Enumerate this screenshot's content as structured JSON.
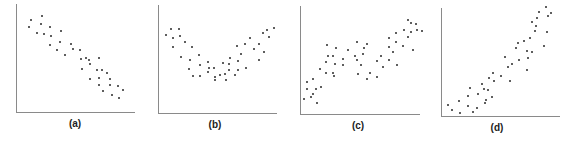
{
  "chart_data": [
    {
      "type": "scatter",
      "label": "(a)",
      "description": "negative linear relationship",
      "title": "",
      "xlabel": "",
      "ylabel": "",
      "grid": false,
      "axes": {
        "x0": 16,
        "y0": 112,
        "x1": 135,
        "ytop": 4
      },
      "label_pos": {
        "x": 75,
        "y": 118
      },
      "points_px": [
        [
          31,
          20
        ],
        [
          42,
          16
        ],
        [
          29,
          27
        ],
        [
          41,
          24
        ],
        [
          50,
          27
        ],
        [
          37,
          33
        ],
        [
          44,
          34
        ],
        [
          51,
          36
        ],
        [
          61,
          31
        ],
        [
          60,
          42
        ],
        [
          50,
          45
        ],
        [
          57,
          50
        ],
        [
          71,
          44
        ],
        [
          65,
          55
        ],
        [
          73,
          49
        ],
        [
          80,
          50
        ],
        [
          81,
          59
        ],
        [
          86,
          58
        ],
        [
          89,
          60
        ],
        [
          99,
          58
        ],
        [
          82,
          69
        ],
        [
          90,
          64
        ],
        [
          102,
          70
        ],
        [
          97,
          70
        ],
        [
          107,
          73
        ],
        [
          90,
          79
        ],
        [
          99,
          78
        ],
        [
          110,
          79
        ],
        [
          99,
          85
        ],
        [
          110,
          85
        ],
        [
          118,
          86
        ],
        [
          103,
          91
        ],
        [
          112,
          95
        ],
        [
          119,
          98
        ],
        [
          123,
          90
        ]
      ]
    },
    {
      "type": "scatter",
      "label": "(b)",
      "description": "U-shaped (quadratic) relationship",
      "title": "",
      "xlabel": "",
      "ylabel": "",
      "grid": false,
      "axes": {
        "x0": 158,
        "y0": 113,
        "x1": 277,
        "ytop": 5
      },
      "label_pos": {
        "x": 215,
        "y": 119
      },
      "points_px": [
        [
          171,
          29
        ],
        [
          179,
          29
        ],
        [
          166,
          35
        ],
        [
          173,
          38
        ],
        [
          180,
          36
        ],
        [
          173,
          47
        ],
        [
          185,
          42
        ],
        [
          192,
          47
        ],
        [
          181,
          57
        ],
        [
          190,
          60
        ],
        [
          199,
          55
        ],
        [
          200,
          65
        ],
        [
          208,
          62
        ],
        [
          189,
          69
        ],
        [
          209,
          68
        ],
        [
          193,
          76
        ],
        [
          200,
          76
        ],
        [
          220,
          75
        ],
        [
          208,
          72
        ],
        [
          215,
          77
        ],
        [
          225,
          74
        ],
        [
          229,
          64
        ],
        [
          223,
          63
        ],
        [
          229,
          70
        ],
        [
          238,
          70
        ],
        [
          246,
          68
        ],
        [
          238,
          61
        ],
        [
          241,
          54
        ],
        [
          245,
          44
        ],
        [
          254,
          49
        ],
        [
          259,
          60
        ],
        [
          264,
          52
        ],
        [
          259,
          44
        ],
        [
          263,
          33
        ],
        [
          274,
          28
        ],
        [
          269,
          37
        ],
        [
          267,
          30
        ],
        [
          226,
          80
        ],
        [
          235,
          75
        ],
        [
          215,
          80
        ],
        [
          214,
          68
        ],
        [
          230,
          58
        ],
        [
          237,
          46
        ],
        [
          250,
          38
        ]
      ]
    },
    {
      "type": "scatter",
      "label": "(c)",
      "description": "cubic / wave-shaped increasing relationship",
      "title": "",
      "xlabel": "",
      "ylabel": "",
      "grid": false,
      "axes": {
        "x0": 300,
        "y0": 114,
        "x1": 420,
        "ytop": 6
      },
      "label_pos": {
        "x": 358,
        "y": 120
      },
      "points_px": [
        [
          304,
          99
        ],
        [
          307,
          89
        ],
        [
          311,
          97
        ],
        [
          307,
          82
        ],
        [
          313,
          79
        ],
        [
          316,
          89
        ],
        [
          317,
          103
        ],
        [
          313,
          94
        ],
        [
          321,
          87
        ],
        [
          326,
          73
        ],
        [
          320,
          69
        ],
        [
          326,
          62
        ],
        [
          333,
          73
        ],
        [
          328,
          56
        ],
        [
          335,
          64
        ],
        [
          336,
          48
        ],
        [
          327,
          45
        ],
        [
          333,
          56
        ],
        [
          343,
          59
        ],
        [
          348,
          50
        ],
        [
          355,
          56
        ],
        [
          357,
          42
        ],
        [
          364,
          48
        ],
        [
          357,
          60
        ],
        [
          361,
          65
        ],
        [
          363,
          54
        ],
        [
          367,
          44
        ],
        [
          377,
          61
        ],
        [
          370,
          73
        ],
        [
          381,
          56
        ],
        [
          389,
          47
        ],
        [
          389,
          60
        ],
        [
          393,
          52
        ],
        [
          397,
          65
        ],
        [
          396,
          42
        ],
        [
          389,
          38
        ],
        [
          403,
          46
        ],
        [
          396,
          33
        ],
        [
          404,
          30
        ],
        [
          411,
          32
        ],
        [
          408,
          37
        ],
        [
          411,
          23
        ],
        [
          417,
          30
        ],
        [
          408,
          20
        ],
        [
          416,
          24
        ],
        [
          422,
          31
        ],
        [
          413,
          50
        ],
        [
          383,
          67
        ],
        [
          377,
          77
        ],
        [
          367,
          79
        ],
        [
          358,
          74
        ],
        [
          343,
          65
        ],
        [
          334,
          76
        ]
      ]
    },
    {
      "type": "scatter",
      "label": "(d)",
      "description": "positive curvilinear (exponential-like) relationship",
      "title": "",
      "xlabel": "",
      "ylabel": "",
      "grid": false,
      "axes": {
        "x0": 441,
        "y0": 116,
        "x1": 560,
        "ytop": 8
      },
      "label_pos": {
        "x": 497,
        "y": 122
      },
      "points_px": [
        [
          448,
          105
        ],
        [
          452,
          110
        ],
        [
          460,
          113
        ],
        [
          473,
          112
        ],
        [
          459,
          101
        ],
        [
          468,
          106
        ],
        [
          477,
          108
        ],
        [
          485,
          103
        ],
        [
          468,
          96
        ],
        [
          478,
          94
        ],
        [
          492,
          97
        ],
        [
          484,
          89
        ],
        [
          482,
          84
        ],
        [
          494,
          81
        ],
        [
          470,
          88
        ],
        [
          489,
          78
        ],
        [
          510,
          81
        ],
        [
          501,
          76
        ],
        [
          508,
          67
        ],
        [
          493,
          73
        ],
        [
          505,
          57
        ],
        [
          519,
          60
        ],
        [
          516,
          48
        ],
        [
          524,
          41
        ],
        [
          518,
          43
        ],
        [
          527,
          51
        ],
        [
          527,
          70
        ],
        [
          535,
          31
        ],
        [
          530,
          38
        ],
        [
          532,
          22
        ],
        [
          536,
          26
        ],
        [
          547,
          32
        ],
        [
          539,
          12
        ],
        [
          537,
          18
        ],
        [
          548,
          16
        ],
        [
          528,
          58
        ],
        [
          544,
          46
        ],
        [
          551,
          13
        ],
        [
          546,
          7
        ],
        [
          532,
          52
        ],
        [
          512,
          64
        ],
        [
          488,
          90
        ],
        [
          486,
          100
        ]
      ]
    }
  ],
  "panels": [
    {
      "label": "(a)"
    },
    {
      "label": "(b)"
    },
    {
      "label": "(c)"
    },
    {
      "label": "(d)"
    }
  ],
  "colors": {
    "axis": "#8a8a8a",
    "dot": "#2a2a2a",
    "label": "#222222"
  }
}
